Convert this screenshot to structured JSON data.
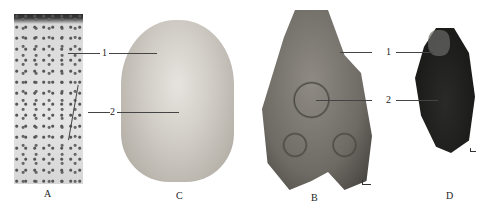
{
  "figure": {
    "panels": [
      {
        "id": "A",
        "label": "A",
        "description": "histological section with stained cells"
      },
      {
        "id": "C",
        "label": "C",
        "description": "oval pale disc specimen"
      },
      {
        "id": "B",
        "label": "B",
        "description": "rough rock-like lobed specimen"
      },
      {
        "id": "D",
        "label": "D",
        "description": "dark granular specimen"
      }
    ],
    "callouts": {
      "one": "1",
      "two": "2"
    },
    "colors": {
      "background": "#ffffff",
      "panel_c": "#b8b2a8",
      "panel_b": "#6f6c66",
      "panel_d": "#2a2a28"
    }
  }
}
